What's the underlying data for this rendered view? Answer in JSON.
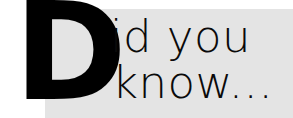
{
  "graphic": {
    "kind": "did-you-know-wordmark",
    "dropcap": "D",
    "lines": [
      "id you",
      "know..."
    ],
    "full_text": "Did you know...",
    "colors": {
      "canvas": "#ffffff",
      "band": "#e4e4e4",
      "dropcap": "#000000",
      "text": "#0a0a0a"
    }
  }
}
